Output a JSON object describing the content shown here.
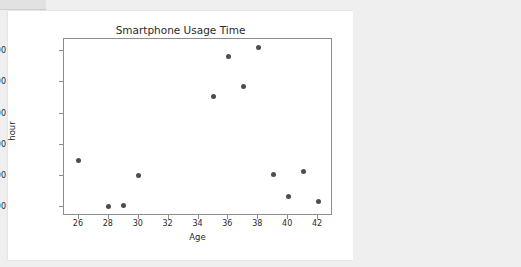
{
  "chart_data": {
    "type": "scatter",
    "title": "Smartphone Usage Time",
    "xlabel": "Age",
    "ylabel": "hour",
    "xlim": [
      25,
      43
    ],
    "ylim": [
      540,
      1680
    ],
    "xticks": [
      26,
      28,
      30,
      32,
      34,
      36,
      38,
      40,
      42
    ],
    "xtick_labels": [
      "26",
      "28",
      "30",
      "32",
      "34",
      "36",
      "38",
      "40",
      "42"
    ],
    "yticks": [
      600,
      800,
      1000,
      1200,
      1400,
      1600
    ],
    "ytick_labels": [
      "600",
      "800",
      "1000",
      "1200",
      "1400",
      "1600"
    ],
    "grid": false,
    "legend": null,
    "marker_color": "#4d4d4d",
    "x": [
      26,
      28,
      29,
      30,
      35,
      36,
      37,
      38,
      39,
      40,
      41,
      42
    ],
    "y": [
      900,
      600,
      605,
      800,
      1310,
      1570,
      1375,
      1625,
      805,
      665,
      825,
      635
    ],
    "points": [
      {
        "x": 26,
        "y": 900
      },
      {
        "x": 28,
        "y": 600
      },
      {
        "x": 29,
        "y": 605
      },
      {
        "x": 30,
        "y": 800
      },
      {
        "x": 35,
        "y": 1310
      },
      {
        "x": 36,
        "y": 1570
      },
      {
        "x": 37,
        "y": 1375
      },
      {
        "x": 38,
        "y": 1625
      },
      {
        "x": 39,
        "y": 805
      },
      {
        "x": 40,
        "y": 665
      },
      {
        "x": 41,
        "y": 825
      },
      {
        "x": 42,
        "y": 635
      }
    ]
  },
  "figure": {
    "title": "Smartphone Usage Time",
    "axis_x_label": "Age",
    "axis_y_label": "hour"
  }
}
